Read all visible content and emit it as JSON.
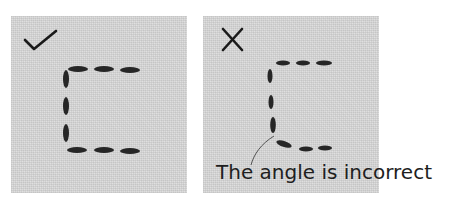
{
  "panels": [
    {
      "id": "correct",
      "mark": "checkmark-icon",
      "verdict": "correct"
    },
    {
      "id": "incorrect",
      "mark": "cross-icon",
      "verdict": "incorrect"
    }
  ],
  "caption": "The angle is incorrect",
  "colors": {
    "fabric": "#dcdcdc",
    "stitch": "#222222",
    "text": "#1e1e1e"
  }
}
